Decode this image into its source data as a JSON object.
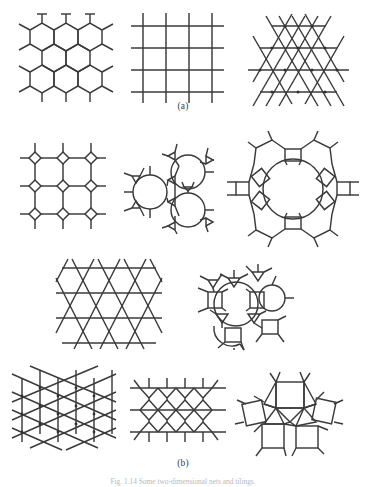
{
  "figure": {
    "width": 366,
    "height": 487,
    "background_color": "#ffffff",
    "stroke_color": "#3a3a3a",
    "caption_bottom": "Fig. 1.14 Some two-dimensional nets and tilings."
  },
  "panels": [
    {
      "id": "a",
      "label": "(a)",
      "label_x": 183,
      "label_y": 101
    },
    {
      "id": "b",
      "label": "(b)",
      "label_x": 183,
      "label_y": 458
    }
  ],
  "diagrams": [
    {
      "name": "honeycomb-net",
      "panel": "a",
      "row": 1,
      "description": "Hexagonal honeycomb net (6.6.6) with pendant bonds",
      "x": 16,
      "y": 18,
      "width": 104,
      "height": 80
    },
    {
      "name": "square-net",
      "panel": "a",
      "row": 1,
      "description": "Square net (4.4.4.4) four by four grid with pendant bonds",
      "x": 133,
      "y": 18,
      "width": 94,
      "height": 80
    },
    {
      "name": "triangular-net",
      "panel": "a",
      "row": 1,
      "description": "Triangular net (3.3.3.3.3.3) with hexagonal outline",
      "x": 246,
      "y": 18,
      "width": 105,
      "height": 80
    },
    {
      "name": "square-octagon-net",
      "panel": "b",
      "row": 2,
      "description": "4.8.8 net of small squares linked into octagons",
      "x": 22,
      "y": 146,
      "width": 82,
      "height": 82
    },
    {
      "name": "triangle-dodecagon-net",
      "panel": "b",
      "row": 2,
      "description": "3.12.12 net of triangles and large twelve-membered rings",
      "x": 124,
      "y": 146,
      "width": 90,
      "height": 84
    },
    {
      "name": "large-ring-net",
      "panel": "b",
      "row": 2,
      "description": "Net built from squares and pentagons around a large circular ring",
      "x": 234,
      "y": 134,
      "width": 118,
      "height": 110
    },
    {
      "name": "kagome-net",
      "panel": "b",
      "row": 3,
      "description": "Kagome net of crossing lines forming triangles and hexagons",
      "x": 56,
      "y": 262,
      "width": 106,
      "height": 84
    },
    {
      "name": "square-triangle-ring-net",
      "panel": "b",
      "row": 3,
      "description": "Net of squares, triangles and large rings",
      "x": 192,
      "y": 258,
      "width": 104,
      "height": 92
    },
    {
      "name": "rhombic-net",
      "panel": "b",
      "row": 4,
      "description": "Rhombic / triangular net with vertical bars and nodes",
      "x": 14,
      "y": 372,
      "width": 102,
      "height": 76
    },
    {
      "name": "elongated-hexagon-net",
      "panel": "b",
      "row": 4,
      "description": "Net of elongated hexagons in rows joined by horizontal lines",
      "x": 132,
      "y": 376,
      "width": 92,
      "height": 70
    },
    {
      "name": "square-triangle-net",
      "panel": "b",
      "row": 4,
      "description": "3.3.4.3.4 net of mixed squares and triangles",
      "x": 240,
      "y": 374,
      "width": 100,
      "height": 74
    }
  ]
}
